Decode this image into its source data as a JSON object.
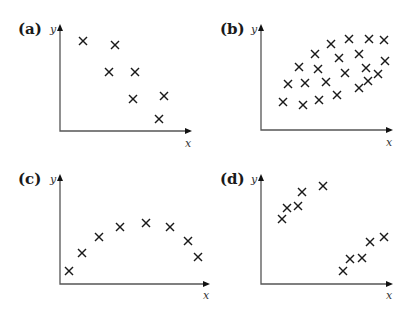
{
  "figure": {
    "panels": [
      {
        "label": "(a)",
        "xlabel": "x",
        "ylabel": "y",
        "pattern": "negative linear correlation"
      },
      {
        "label": "(b)",
        "xlabel": "x",
        "ylabel": "y",
        "pattern": "weak positive correlation"
      },
      {
        "label": "(c)",
        "xlabel": "x",
        "ylabel": "y",
        "pattern": "non-linear (quadratic) relationship"
      },
      {
        "label": "(d)",
        "xlabel": "x",
        "ylabel": "y",
        "pattern": "two separate positively correlated clusters"
      }
    ]
  },
  "chart_data": [
    {
      "type": "scatter",
      "title": "(a)",
      "xlabel": "x",
      "ylabel": "y",
      "grid": false,
      "x": [
        2.3,
        5.5,
        4.9,
        7.5,
        7.3,
        10.4,
        9.9
      ],
      "y": [
        9.0,
        8.6,
        5.9,
        5.9,
        3.2,
        3.5,
        1.2
      ]
    },
    {
      "type": "scatter",
      "title": "(b)",
      "xlabel": "x",
      "ylabel": "y",
      "grid": false,
      "x": [
        2.2,
        4.2,
        5.8,
        7.6,
        9.8,
        10.7,
        11.7,
        2.7,
        4.4,
        6.5,
        8.4,
        10.5,
        12.4,
        3.8,
        5.7,
        7.8,
        9.8,
        5.4,
        7.0,
        8.8,
        10.8,
        12.3
      ],
      "y": [
        2.8,
        2.5,
        3.0,
        3.5,
        4.2,
        4.9,
        5.6,
        4.6,
        4.7,
        4.8,
        5.7,
        6.2,
        6.9,
        6.3,
        6.1,
        7.2,
        7.6,
        7.6,
        8.6,
        9.1,
        9.1,
        9.0
      ]
    },
    {
      "type": "scatter",
      "title": "(c)",
      "xlabel": "x",
      "ylabel": "y",
      "grid": false,
      "x": [
        0.9,
        2.2,
        3.9,
        6.0,
        8.6,
        11.0,
        12.8,
        13.8
      ],
      "y": [
        1.3,
        3.1,
        4.7,
        5.7,
        6.1,
        5.7,
        4.3,
        2.7
      ]
    },
    {
      "type": "scatter",
      "title": "(d)",
      "xlabel": "x",
      "ylabel": "y",
      "grid": false,
      "x": [
        2.1,
        2.6,
        3.7,
        4.1,
        6.2,
        8.2,
        8.9,
        10.1,
        10.9,
        12.3
      ],
      "y": [
        6.5,
        7.6,
        7.8,
        9.2,
        9.8,
        1.3,
        2.5,
        2.6,
        4.2,
        4.7
      ]
    }
  ],
  "markers_px": {
    "a": [
      [
        83,
        41
      ],
      [
        115,
        45
      ],
      [
        109,
        72
      ],
      [
        135,
        72
      ],
      [
        133,
        99
      ],
      [
        164,
        96
      ],
      [
        159,
        119
      ]
    ],
    "b": [
      [
        283,
        102
      ],
      [
        303,
        105
      ],
      [
        319,
        100
      ],
      [
        337,
        95
      ],
      [
        359,
        88
      ],
      [
        368,
        81
      ],
      [
        378,
        74
      ],
      [
        288,
        84
      ],
      [
        305,
        83
      ],
      [
        326,
        82
      ],
      [
        345,
        73
      ],
      [
        366,
        68
      ],
      [
        385,
        61
      ],
      [
        299,
        67
      ],
      [
        318,
        69
      ],
      [
        339,
        58
      ],
      [
        359,
        54
      ],
      [
        315,
        54
      ],
      [
        331,
        44
      ],
      [
        349,
        39
      ],
      [
        369,
        39
      ],
      [
        384,
        40
      ]
    ],
    "c": [
      [
        69,
        271
      ],
      [
        82,
        253
      ],
      [
        99,
        237
      ],
      [
        120,
        227
      ],
      [
        146,
        223
      ],
      [
        170,
        227
      ],
      [
        188,
        241
      ],
      [
        198,
        257
      ]
    ],
    "d": [
      [
        282,
        219
      ],
      [
        287,
        208
      ],
      [
        298,
        206
      ],
      [
        302,
        192
      ],
      [
        323,
        186
      ],
      [
        343,
        271
      ],
      [
        350,
        259
      ],
      [
        362,
        258
      ],
      [
        370,
        242
      ],
      [
        384,
        237
      ]
    ]
  }
}
